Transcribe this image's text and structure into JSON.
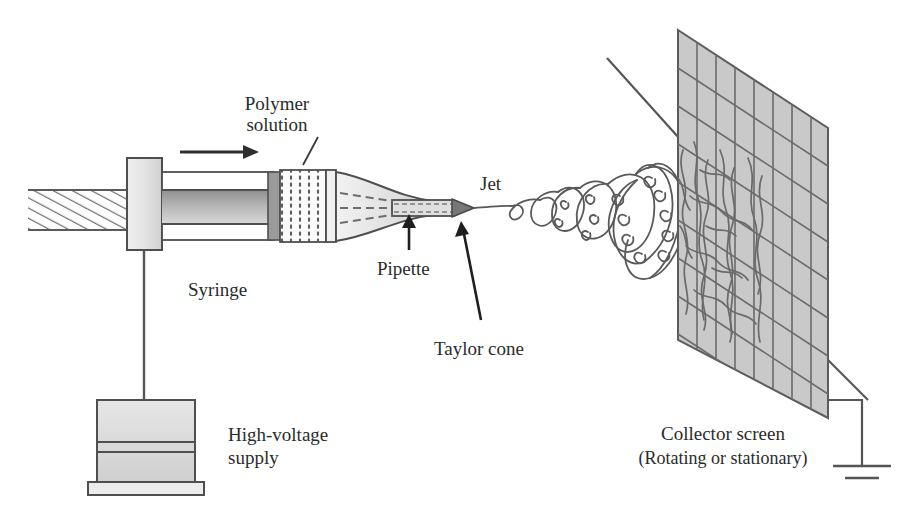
{
  "figure": {
    "background_color": "#ffffff",
    "ink_color": "#4a4a4a",
    "text_color": "#2b2b2b",
    "screen_fill_color": "#c9c9c9",
    "width": 912,
    "height": 522
  },
  "labels": {
    "polymer_solution_line1": "Polymer",
    "polymer_solution_line2": "solution",
    "syringe": "Syringe",
    "pipette": "Pipette",
    "taylor_cone": "Taylor cone",
    "jet": "Jet",
    "high_voltage_line1": "High-voltage",
    "high_voltage_line2": "supply",
    "collector_line1": "Collector screen",
    "collector_line2": "(Rotating or stationary)"
  },
  "components": {
    "plunger_rod": "threaded-plunger-rod",
    "plunger_flange": "plunger-flange-block",
    "syringe_barrel": "syringe-barrel",
    "solution_chamber": "polymer-solution-chamber",
    "nozzle": "tapered-nozzle",
    "pipette_tube": "pipette-tube",
    "taylor_cone_tip": "taylor-cone-tip",
    "jet_path": "whipping-jet",
    "collector_screen": "collector-screen-mesh",
    "deposited_fibers": "deposited-fiber-mat",
    "support_rod": "screen-support-rod",
    "hv_supply": "high-voltage-supply-box",
    "hv_wire": "high-voltage-wire",
    "ground_wire": "ground-wire",
    "ground_symbol": "earth-ground-symbol",
    "flow_arrow": "flow-direction-arrow"
  }
}
